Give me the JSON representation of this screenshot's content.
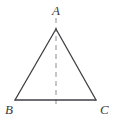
{
  "figure": {
    "kind": "geometry-diagram",
    "background_color": "#ffffff",
    "stroke_color": "#3f3f46",
    "stroke_width": 1.3,
    "dash_color": "#b8b8b8",
    "dash_width": 1.6,
    "dash_pattern": "5,4",
    "label_color": "#3b3b3b",
    "labels": {
      "apex": "A",
      "base_left": "B",
      "base_right": "C"
    },
    "points": {
      "A": {
        "x": 56,
        "y": 29
      },
      "B": {
        "x": 15,
        "y": 100
      },
      "C": {
        "x": 96,
        "y": 100
      }
    },
    "altitude": {
      "x": 56,
      "y_top": 18,
      "y_bottom": 105
    }
  }
}
